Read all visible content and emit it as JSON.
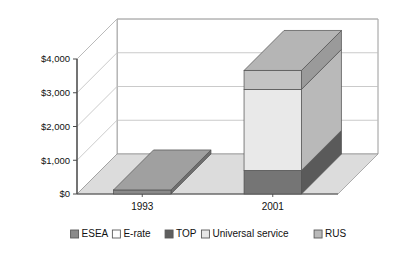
{
  "chart_data": {
    "type": "bar",
    "subtype": "3d-stacked-column",
    "title": "",
    "xlabel": "",
    "ylabel": "",
    "categories": [
      "1993",
      "2001"
    ],
    "ylim": [
      0,
      4000
    ],
    "ytick_values": [
      0,
      1000,
      2000,
      3000,
      4000
    ],
    "ytick_labels": [
      "$0",
      "$1,000",
      "$2,000",
      "$3,000",
      "$4,000"
    ],
    "grid": true,
    "legend_position": "bottom",
    "series": [
      {
        "name": "ESEA",
        "values": [
          120,
          0
        ],
        "color": "#8a8a8a",
        "side_color": "#6e6e6e",
        "top_color": "#a0a0a0"
      },
      {
        "name": "E-rate",
        "values": [
          0,
          0
        ],
        "color": "#fbfbfb",
        "side_color": "#d8d8d8",
        "top_color": "#ffffff"
      },
      {
        "name": "TOP",
        "values": [
          0,
          700
        ],
        "color": "#757575",
        "side_color": "#5a5a5a",
        "top_color": "#8c8c8c"
      },
      {
        "name": "Universal service",
        "values": [
          0,
          2400
        ],
        "color": "#e9e9e9",
        "side_color": "#b9b9b9",
        "top_color": "#f3f3f3"
      },
      {
        "name": "RUS",
        "values": [
          0,
          560
        ],
        "color": "#c3c3c3",
        "side_color": "#9a9a9a",
        "top_color": "#b5b5b5"
      }
    ],
    "totals": [
      120,
      3660
    ]
  },
  "legend": {
    "items": [
      {
        "label": "ESEA",
        "swatch": "#8a8a8a"
      },
      {
        "label": "E-rate",
        "swatch": "#fdfdfd"
      },
      {
        "label": "TOP",
        "swatch": "#5f5f5f"
      },
      {
        "label": "Universal service",
        "swatch": "#e6e6e6"
      },
      {
        "label": "RUS",
        "swatch": "#b9b9b9"
      }
    ]
  },
  "axis": {
    "y_labels": [
      "$4,000",
      "$3,000",
      "$2,000",
      "$1,000",
      "$0"
    ],
    "x_labels": [
      "1993",
      "2001"
    ]
  },
  "colors": {
    "plot_border": "#9a9a9a",
    "gridline": "#bdbdbd",
    "axis_line": "#4a4a4a",
    "floor": "#dcdcdc",
    "floor_edge": "#9a9a9a",
    "text": "#111111",
    "background": "#ffffff"
  }
}
